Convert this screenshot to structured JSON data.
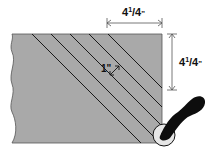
{
  "diagram": {
    "labels": {
      "top_dimension": {
        "whole": "4",
        "num": "1",
        "den": "4",
        "unit": "\""
      },
      "side_dimension": {
        "whole": "4",
        "num": "1",
        "den": "4",
        "unit": "\""
      },
      "strip_width": "1\""
    },
    "colors": {
      "fabric": "#a9a9a9",
      "line": "#1a1a1a",
      "cutter_handle": "#0d0d0d",
      "cutter_blade": "#e6e6e6",
      "dimension_line": "#555555"
    }
  }
}
